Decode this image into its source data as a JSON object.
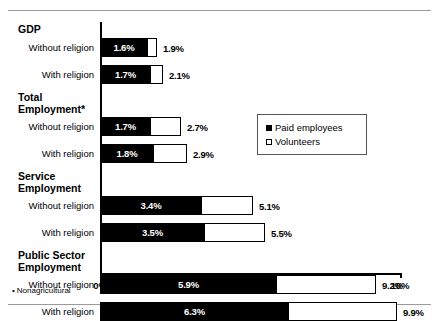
{
  "chart_data": {
    "type": "bar",
    "orientation": "horizontal",
    "stacked": true,
    "title": "",
    "xlabel": "",
    "ylabel": "",
    "xlim": [
      0,
      10
    ],
    "xunit": "%",
    "grid": false,
    "tick_labels": [
      "0%",
      "2%",
      "4%",
      "6%",
      "8%",
      "10%"
    ],
    "tick_values": [
      0,
      2,
      4,
      6,
      8,
      10
    ],
    "legend": {
      "position": "inside-right-upper",
      "entries": [
        {
          "label": "Paid employees",
          "swatch": "filled"
        },
        {
          "label": "Volunteers",
          "swatch": "hollow"
        }
      ]
    },
    "series": [
      {
        "name": "Paid employees",
        "values": [
          1.6,
          1.7,
          1.7,
          1.8,
          3.4,
          3.5,
          5.9,
          6.3
        ]
      },
      {
        "name": "Volunteers",
        "values": [
          0.3,
          0.4,
          1.0,
          1.1,
          1.7,
          2.0,
          3.3,
          3.6
        ]
      }
    ],
    "groups": [
      {
        "label": "GDP",
        "rows": [
          {
            "label": "Without religion",
            "paid": 1.6,
            "paid_label": "1.6%",
            "total": 1.9,
            "total_label": "1.9%"
          },
          {
            "label": "With religion",
            "paid": 1.7,
            "paid_label": "1.7%",
            "total": 2.1,
            "total_label": "2.1%"
          }
        ]
      },
      {
        "label": "Total\nEmployment*",
        "rows": [
          {
            "label": "Without religion",
            "paid": 1.7,
            "paid_label": "1.7%",
            "total": 2.7,
            "total_label": "2.7%"
          },
          {
            "label": "With religion",
            "paid": 1.8,
            "paid_label": "1.8%",
            "total": 2.9,
            "total_label": "2.9%"
          }
        ]
      },
      {
        "label": "Service\nEmployment",
        "rows": [
          {
            "label": "Without religion",
            "paid": 3.4,
            "paid_label": "3.4%",
            "total": 5.1,
            "total_label": "5.1%"
          },
          {
            "label": "With religion",
            "paid": 3.5,
            "paid_label": "3.5%",
            "total": 5.5,
            "total_label": "5.5%"
          }
        ]
      },
      {
        "label": "Public Sector\nEmployment",
        "rows": [
          {
            "label": "Without religion",
            "paid": 5.9,
            "paid_label": "5.9%",
            "total": 9.2,
            "total_label": "9.2%"
          },
          {
            "label": "With religion",
            "paid": 6.3,
            "paid_label": "6.3%",
            "total": 9.9,
            "total_label": "9.9%"
          }
        ]
      }
    ]
  },
  "footnote": {
    "marker": "•",
    "text": "Nonagricultural"
  },
  "colors": {
    "paid": "#000000",
    "volunteers": "#ffffff",
    "outline": "#000000",
    "rule": "#9a9a9a"
  }
}
